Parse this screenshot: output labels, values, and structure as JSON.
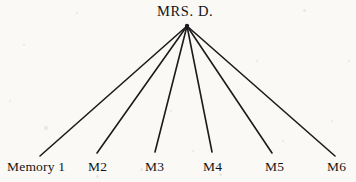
{
  "diagram": {
    "type": "radial-fan-tree",
    "title": "MRS. D.",
    "root": {
      "label": "MRS. D.",
      "x": 187,
      "y": 26
    },
    "leaves": [
      {
        "label": "Memory 1",
        "x": 40,
        "y": 156
      },
      {
        "label": "M2",
        "x": 97,
        "y": 153
      },
      {
        "label": "M3",
        "x": 155,
        "y": 152
      },
      {
        "label": "M4",
        "x": 212,
        "y": 152
      },
      {
        "label": "M5",
        "x": 272,
        "y": 153
      },
      {
        "label": "M6",
        "x": 335,
        "y": 156
      }
    ],
    "colors": {
      "background": "#faf9f6",
      "line": "#1b1b1b",
      "text": "#141414"
    },
    "line_width": 1.6
  }
}
